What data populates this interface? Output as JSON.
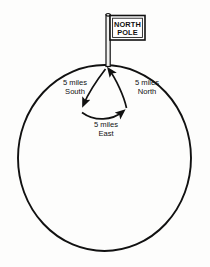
{
  "figure": {
    "background_color": "#fdfdfc",
    "stroke_color": "#111111"
  },
  "flag": {
    "line1": "NORTH",
    "line2": "POLE",
    "fill_color": "#ffffff",
    "border_color": "#111111"
  },
  "pole": {
    "name": "flagpole",
    "fill_color": "#f2f2f0",
    "border_color": "#111111"
  },
  "circle": {
    "name": "latitude-circle",
    "stroke_color": "#111111"
  },
  "labels": {
    "south": {
      "line1": "5 miles",
      "line2": "South"
    },
    "north": {
      "line1": "5 miles",
      "line2": "North"
    },
    "east": {
      "line1": "5 miles",
      "line2": "East"
    }
  },
  "arrows": [
    {
      "name": "south-leg-arrow",
      "direction": "South",
      "length_label": "5 miles",
      "from": "north-pole",
      "to": "southwest"
    },
    {
      "name": "east-leg-arrow",
      "direction": "East",
      "length_label": "5 miles",
      "from": "southwest",
      "to": "southeast"
    },
    {
      "name": "north-leg-arrow",
      "direction": "North",
      "length_label": "5 miles",
      "from": "southeast",
      "to": "north-pole"
    }
  ]
}
